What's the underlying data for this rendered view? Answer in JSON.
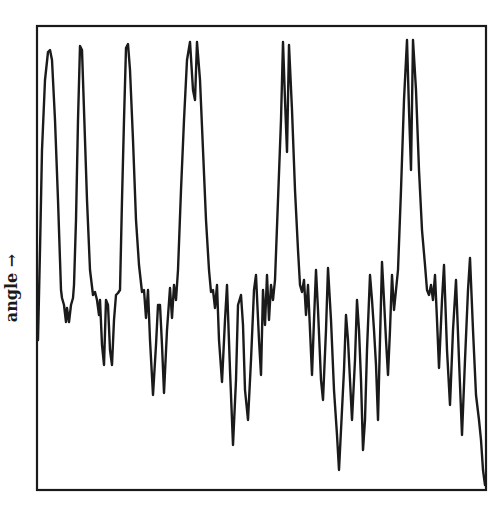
{
  "chart_data": {
    "type": "line",
    "title": "",
    "xlabel": "",
    "ylabel": "angle →",
    "ylabel_text": "angle",
    "ylabel_arrow": "→",
    "grid": false,
    "legend": null,
    "xticks": [],
    "yticks": [],
    "frame": {
      "left": 37,
      "top": 26,
      "right": 486,
      "bottom": 490
    },
    "line_color": "#1a1a1a",
    "series": [
      {
        "name": "angle",
        "points_px": [
          [
            38,
            340
          ],
          [
            40,
            250
          ],
          [
            42,
            150
          ],
          [
            45,
            80
          ],
          [
            48,
            52
          ],
          [
            50,
            50
          ],
          [
            52,
            60
          ],
          [
            55,
            120
          ],
          [
            58,
            200
          ],
          [
            60,
            260
          ],
          [
            61,
            290
          ],
          [
            62,
            298
          ],
          [
            64,
            305
          ],
          [
            66,
            322
          ],
          [
            67,
            308
          ],
          [
            69,
            322
          ],
          [
            71,
            305
          ],
          [
            73,
            298
          ],
          [
            74,
            285
          ],
          [
            76,
            220
          ],
          [
            78,
            120
          ],
          [
            80,
            46
          ],
          [
            82,
            50
          ],
          [
            84,
            110
          ],
          [
            87,
            200
          ],
          [
            90,
            270
          ],
          [
            93,
            295
          ],
          [
            95,
            292
          ],
          [
            97,
            300
          ],
          [
            99,
            315
          ],
          [
            100,
            300
          ],
          [
            102,
            345
          ],
          [
            104,
            365
          ],
          [
            106,
            300
          ],
          [
            108,
            305
          ],
          [
            110,
            350
          ],
          [
            112,
            365
          ],
          [
            114,
            320
          ],
          [
            116,
            295
          ],
          [
            118,
            293
          ],
          [
            120,
            290
          ],
          [
            122,
            200
          ],
          [
            124,
            120
          ],
          [
            126,
            48
          ],
          [
            128,
            44
          ],
          [
            130,
            70
          ],
          [
            133,
            140
          ],
          [
            136,
            220
          ],
          [
            139,
            265
          ],
          [
            142,
            292
          ],
          [
            144,
            290
          ],
          [
            146,
            318
          ],
          [
            148,
            290
          ],
          [
            150,
            340
          ],
          [
            153,
            395
          ],
          [
            156,
            345
          ],
          [
            158,
            305
          ],
          [
            160,
            305
          ],
          [
            162,
            345
          ],
          [
            164,
            393
          ],
          [
            167,
            330
          ],
          [
            170,
            288
          ],
          [
            172,
            318
          ],
          [
            174,
            285
          ],
          [
            176,
            300
          ],
          [
            178,
            270
          ],
          [
            181,
            190
          ],
          [
            184,
            120
          ],
          [
            187,
            60
          ],
          [
            190,
            42
          ],
          [
            193,
            90
          ],
          [
            195,
            100
          ],
          [
            197,
            42
          ],
          [
            200,
            80
          ],
          [
            203,
            150
          ],
          [
            206,
            220
          ],
          [
            209,
            270
          ],
          [
            211,
            292
          ],
          [
            213,
            290
          ],
          [
            215,
            308
          ],
          [
            217,
            285
          ],
          [
            219,
            340
          ],
          [
            222,
            382
          ],
          [
            225,
            320
          ],
          [
            227,
            285
          ],
          [
            230,
            370
          ],
          [
            233,
            445
          ],
          [
            236,
            380
          ],
          [
            238,
            305
          ],
          [
            241,
            295
          ],
          [
            243,
            325
          ],
          [
            245,
            390
          ],
          [
            248,
            420
          ],
          [
            251,
            360
          ],
          [
            254,
            290
          ],
          [
            256,
            275
          ],
          [
            259,
            340
          ],
          [
            261,
            375
          ],
          [
            263,
            290
          ],
          [
            265,
            325
          ],
          [
            267,
            275
          ],
          [
            269,
            320
          ],
          [
            271,
            285
          ],
          [
            273,
            300
          ],
          [
            275,
            280
          ],
          [
            278,
            200
          ],
          [
            281,
            120
          ],
          [
            283,
            42
          ],
          [
            285,
            100
          ],
          [
            287,
            152
          ],
          [
            289,
            45
          ],
          [
            292,
            110
          ],
          [
            295,
            190
          ],
          [
            298,
            250
          ],
          [
            300,
            285
          ],
          [
            302,
            292
          ],
          [
            304,
            280
          ],
          [
            306,
            315
          ],
          [
            308,
            285
          ],
          [
            310,
            330
          ],
          [
            312,
            375
          ],
          [
            314,
            320
          ],
          [
            316,
            270
          ],
          [
            318,
            310
          ],
          [
            321,
            380
          ],
          [
            323,
            400
          ],
          [
            326,
            330
          ],
          [
            328,
            268
          ],
          [
            331,
            320
          ],
          [
            334,
            390
          ],
          [
            337,
            435
          ],
          [
            339,
            470
          ],
          [
            341,
            430
          ],
          [
            344,
            370
          ],
          [
            346,
            315
          ],
          [
            348,
            340
          ],
          [
            350,
            380
          ],
          [
            352,
            420
          ],
          [
            355,
            360
          ],
          [
            357,
            300
          ],
          [
            359,
            330
          ],
          [
            361,
            380
          ],
          [
            363,
            450
          ],
          [
            365,
            420
          ],
          [
            367,
            350
          ],
          [
            370,
            275
          ],
          [
            372,
            300
          ],
          [
            374,
            330
          ],
          [
            376,
            365
          ],
          [
            378,
            420
          ],
          [
            380,
            340
          ],
          [
            382,
            262
          ],
          [
            384,
            300
          ],
          [
            386,
            340
          ],
          [
            388,
            375
          ],
          [
            390,
            330
          ],
          [
            392,
            275
          ],
          [
            394,
            310
          ],
          [
            396,
            290
          ],
          [
            398,
            270
          ],
          [
            401,
            190
          ],
          [
            404,
            100
          ],
          [
            407,
            40
          ],
          [
            409,
            110
          ],
          [
            411,
            170
          ],
          [
            413,
            40
          ],
          [
            416,
            90
          ],
          [
            419,
            170
          ],
          [
            422,
            230
          ],
          [
            425,
            265
          ],
          [
            427,
            290
          ],
          [
            429,
            295
          ],
          [
            431,
            285
          ],
          [
            433,
            300
          ],
          [
            435,
            275
          ],
          [
            437,
            320
          ],
          [
            439,
            368
          ],
          [
            442,
            300
          ],
          [
            444,
            265
          ],
          [
            447,
            350
          ],
          [
            450,
            405
          ],
          [
            453,
            330
          ],
          [
            456,
            280
          ],
          [
            459,
            360
          ],
          [
            462,
            435
          ],
          [
            465,
            360
          ],
          [
            468,
            290
          ],
          [
            470,
            258
          ],
          [
            473,
            330
          ],
          [
            476,
            395
          ],
          [
            479,
            420
          ],
          [
            481,
            440
          ],
          [
            483,
            470
          ],
          [
            485,
            485
          ]
        ],
        "peaks_px_x": [
          49,
          80,
          127,
          190,
          197,
          283,
          289,
          407,
          413
        ],
        "peak_groups": [
          {
            "x": 49,
            "type": "single",
            "top_y": 50
          },
          {
            "x": 80,
            "type": "single",
            "top_y": 46
          },
          {
            "x": 127,
            "type": "single-blunt",
            "top_y": 44
          },
          {
            "x": 193,
            "type": "double",
            "top_y": 42,
            "dip_y": 100
          },
          {
            "x": 286,
            "type": "double",
            "top_y": 42,
            "dip_y": 152
          },
          {
            "x": 410,
            "type": "double",
            "top_y": 40,
            "dip_y": 170
          }
        ]
      }
    ]
  }
}
